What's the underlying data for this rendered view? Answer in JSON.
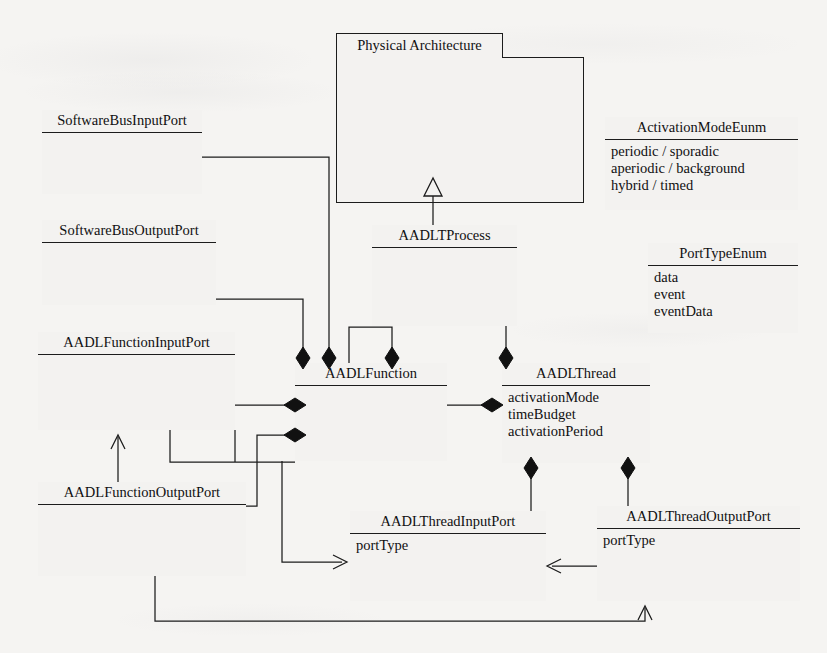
{
  "diagram": {
    "kind": "uml-class-diagram",
    "background_color": "#f5f4f2",
    "line_color": "#1c1c1c"
  },
  "package": {
    "name": "Physical Architecture"
  },
  "classes": {
    "physical_component": {
      "name": "PhyscialComponent",
      "attributes": []
    },
    "aadlt_process": {
      "name": "AADLTProcess",
      "attributes": []
    },
    "software_bus_input_port": {
      "name": "SoftwareBusInputPort",
      "attributes": []
    },
    "software_bus_output_port": {
      "name": "SoftwareBusOutputPort",
      "attributes": []
    },
    "aadl_function_input_port": {
      "name": "AADLFunctionInputPort",
      "attributes": []
    },
    "aadl_function_output_port": {
      "name": "AADLFunctionOutputPort",
      "attributes": []
    },
    "aadl_function": {
      "name": "AADLFunction",
      "attributes": []
    },
    "aadl_thread": {
      "name": "AADLThread",
      "attributes": [
        "activationMode",
        "timeBudget",
        "activationPeriod"
      ]
    },
    "aadl_thread_input_port": {
      "name": "AADLThreadInputPort",
      "attributes": [
        "portType"
      ]
    },
    "aadl_thread_output_port": {
      "name": "AADLThreadOutputPort",
      "attributes": [
        "portType"
      ]
    }
  },
  "enums": {
    "activation_mode": {
      "name": "ActivationModeEunm",
      "literals": [
        "periodic / sporadic",
        "aperiodic / background",
        "hybrid / timed"
      ]
    },
    "port_type": {
      "name": "PortTypeEnum",
      "literals": [
        "data",
        "event",
        "eventData"
      ]
    }
  },
  "relationships": [
    {
      "type": "generalization",
      "from": "AADLTProcess",
      "to": "PhyscialComponent"
    },
    {
      "type": "composition",
      "whole": "AADLFunction",
      "part": "SoftwareBusInputPort"
    },
    {
      "type": "composition",
      "whole": "AADLFunction",
      "part": "SoftwareBusOutputPort"
    },
    {
      "type": "composition",
      "whole": "AADLFunction",
      "part": "AADLFunction"
    },
    {
      "type": "composition",
      "whole": "AADLFunction",
      "part": "AADLFunctionInputPort"
    },
    {
      "type": "composition",
      "whole": "AADLFunction",
      "part": "AADLFunctionOutputPort"
    },
    {
      "type": "composition",
      "whole": "AADLFunction",
      "part": "AADLThread"
    },
    {
      "type": "composition",
      "whole": "AADLTProcess",
      "part": "AADLThread"
    },
    {
      "type": "composition",
      "whole": "AADLThread",
      "part": "AADLThreadInputPort"
    },
    {
      "type": "composition",
      "whole": "AADLThread",
      "part": "AADLThreadOutputPort"
    },
    {
      "type": "association",
      "from": "AADLFunctionOutputPort",
      "to": "AADLFunctionInputPort"
    },
    {
      "type": "association",
      "from": "AADLFunction",
      "to": "AADLThreadInputPort"
    },
    {
      "type": "association",
      "from": "AADLThreadOutputPort",
      "to": "AADLThreadInputPort"
    },
    {
      "type": "association",
      "from": "AADLFunctionOutputPort",
      "to": "AADLThreadOutputPort"
    }
  ]
}
